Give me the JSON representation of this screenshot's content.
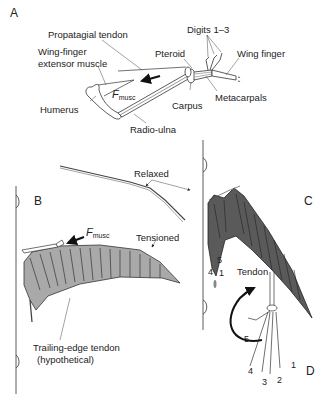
{
  "figure": {
    "panels": {
      "A": "A",
      "B": "B",
      "C": "C",
      "D": "D"
    },
    "panel_a": {
      "labels": {
        "propatagial_tendon": "Propatagial tendon",
        "digits": "Digits 1–3",
        "extensor_line1": "Wing-finger",
        "extensor_line2": "extensor muscle",
        "pteroid": "Pteroid",
        "wing_finger": "Wing finger",
        "humerus": "Humerus",
        "carpus": "Carpus",
        "metacarpals": "Metacarpals",
        "radio_ulna": "Radio-ulna"
      },
      "force": {
        "symbol": "F",
        "subscript": "musc"
      }
    },
    "panel_b": {
      "labels": {
        "relaxed": "Relaxed",
        "tensioned": "Tensioned",
        "trailing_line1": "Trailing-edge tendon",
        "trailing_line2": "(hypothetical)"
      },
      "force": {
        "symbol": "F",
        "subscript": "musc"
      },
      "membrane_color": "#a9a9a9"
    },
    "panel_c": {
      "digit_labels": {
        "d5": "5",
        "d4": "4",
        "d1": "1"
      },
      "membrane_color": "#5a5a5a"
    },
    "panel_d": {
      "tendon_label": "Tendon",
      "digit_labels": [
        "1",
        "2",
        "3",
        "4",
        "5"
      ]
    }
  }
}
